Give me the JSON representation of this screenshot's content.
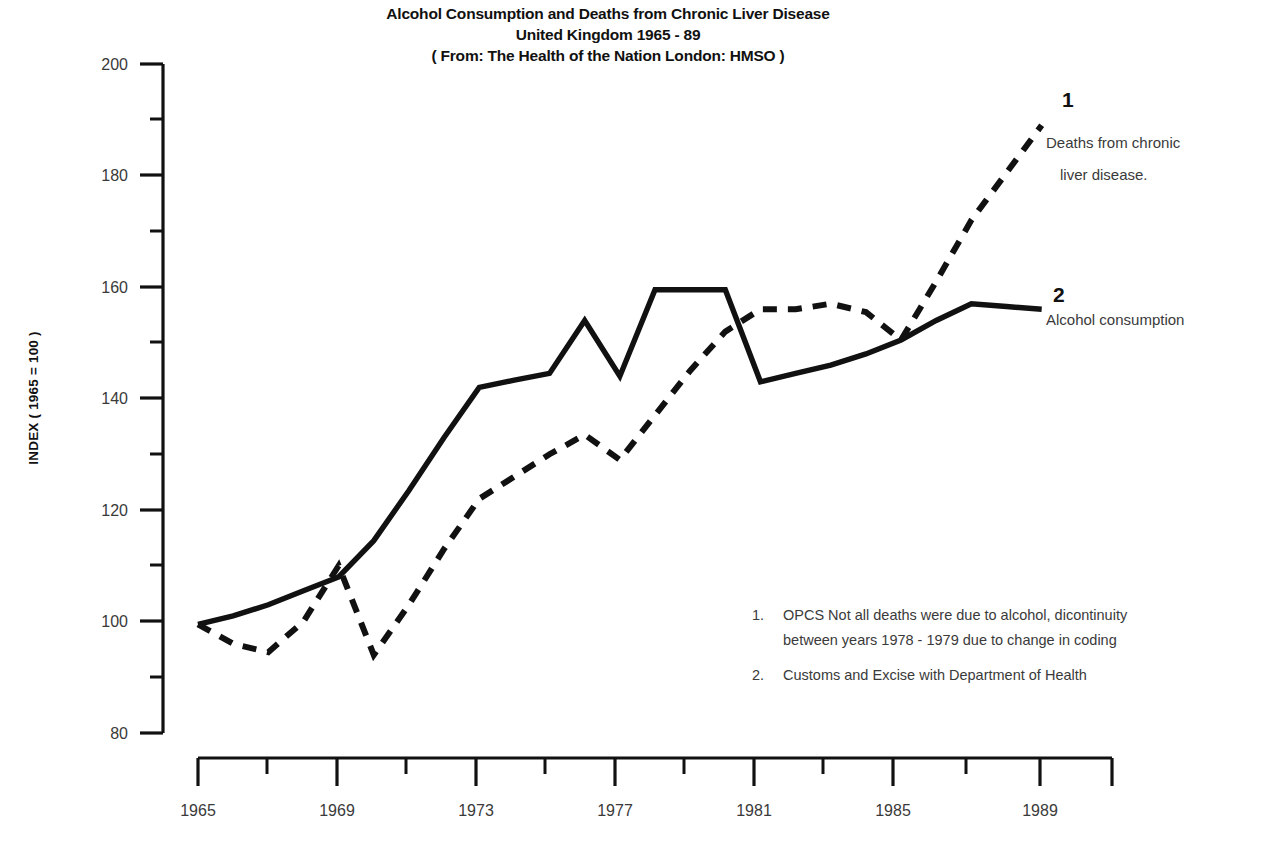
{
  "chart_data": {
    "type": "line",
    "title": "Alcohol Consumption and Deaths from Chronic Liver Disease United Kingdom 1965 - 89 ( From: The Health of the Nation London: HMSO )",
    "title_lines": [
      "Alcohol Consumption and Deaths from Chronic Liver Disease",
      "United Kingdom 1965 - 89",
      "( From: The Health of the Nation London: HMSO )"
    ],
    "xlabel": "",
    "ylabel": "INDEX ( 1965 = 100 )",
    "xlim": [
      1965,
      1991
    ],
    "ylim": [
      80,
      200
    ],
    "grid": false,
    "legend_position": "right-inline",
    "y_ticks_major": [
      80,
      100,
      120,
      140,
      160,
      180,
      200
    ],
    "y_ticks_minor": [
      90,
      110,
      130,
      150,
      170,
      190
    ],
    "x_ticks_major": [
      1965,
      1969,
      1973,
      1977,
      1981,
      1985,
      1989
    ],
    "x_ticks_minor": [
      1967,
      1971,
      1975,
      1979,
      1983,
      1987
    ],
    "x_tick_labels": [
      "1965",
      "1969",
      "1973",
      "1977",
      "1981",
      "1985",
      "1989"
    ],
    "y_tick_labels": [
      "200",
      "180",
      "160",
      "140",
      "120",
      "100",
      "80"
    ],
    "series": [
      {
        "key": "deaths",
        "name": "Deaths from chronic liver disease.",
        "marker_number": "1",
        "style": "dashed",
        "color": "#111111",
        "source_note": "OPCS  Not all deaths were due to alcohol, dicontinuity between years 1978 - 1979 due to change in coding",
        "x": [
          1965,
          1966,
          1967,
          1968,
          1969,
          1970,
          1971,
          1972,
          1973,
          1974,
          1975,
          1976,
          1977,
          1978,
          1979,
          1980,
          1981,
          1982,
          1983,
          1984,
          1985,
          1986,
          1987,
          1988,
          1989
        ],
        "values": [
          99.5,
          96,
          94.5,
          100,
          110,
          94,
          103,
          113,
          122,
          126,
          130,
          133.5,
          129,
          137,
          145,
          152,
          156,
          156,
          157,
          155.5,
          150.5,
          161,
          172,
          180.5,
          189
        ]
      },
      {
        "key": "alcohol",
        "name": "Alcohol consumption",
        "marker_number": "2",
        "style": "solid",
        "color": "#111111",
        "source_note": "Customs and Excise with Department of Health",
        "x": [
          1965,
          1966,
          1967,
          1968,
          1969,
          1970,
          1971,
          1972,
          1973,
          1974,
          1975,
          1976,
          1977,
          1978,
          1979,
          1980,
          1981,
          1982,
          1983,
          1984,
          1985,
          1986,
          1987,
          1988,
          1989
        ],
        "values": [
          99.5,
          101,
          103,
          105.5,
          108,
          114.5,
          123.5,
          133,
          142,
          143.3,
          144.5,
          154,
          144,
          159.5,
          159.5,
          159.5,
          143,
          144.5,
          146,
          148,
          150.5,
          154,
          157,
          156.5,
          156
        ]
      }
    ],
    "annotations": [
      {
        "id": "note-1",
        "number": "1.",
        "text": "OPCS  Not all deaths were due to alcohol, dicontinuity"
      },
      {
        "id": "note-1b",
        "number": "",
        "text": "between years 1978 - 1979 due to change in coding"
      },
      {
        "id": "note-2",
        "number": "2.",
        "text": "Customs and Excise with Department of Health"
      }
    ]
  },
  "labels": {
    "series1_number": "1",
    "series1_line1": "Deaths from chronic",
    "series1_line2": "liver disease.",
    "series2_number": "2",
    "series2_line1": "Alcohol consumption"
  },
  "notes": {
    "n1_num": "1.",
    "n1_l1": "OPCS  Not all deaths were due to alcohol, dicontinuity",
    "n1_l2": "between years 1978 - 1979 due to change in coding",
    "n2_num": "2.",
    "n2_l1": "Customs and Excise with Department of Health"
  },
  "colors": {
    "ink": "#111111",
    "text_grey": "#3a3a3a",
    "background": "#ffffff"
  }
}
